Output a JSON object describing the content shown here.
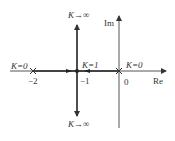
{
  "diagram": {
    "type": "root-locus",
    "axes": {
      "real_label": "Re",
      "imag_label": "Im"
    },
    "ticks": {
      "minus2": "−2",
      "minus1": "−1",
      "zero": "0"
    },
    "poles": [
      {
        "value": -2,
        "label": "K=0"
      },
      {
        "value": 0,
        "label": "K=0"
      }
    ],
    "breakaway": {
      "value": -1,
      "label": "K=1"
    },
    "asymptote_labels": {
      "top": "K→∞",
      "bottom": "K→∞"
    },
    "colors": {
      "line": "#333333",
      "background": "#ffffff"
    }
  }
}
